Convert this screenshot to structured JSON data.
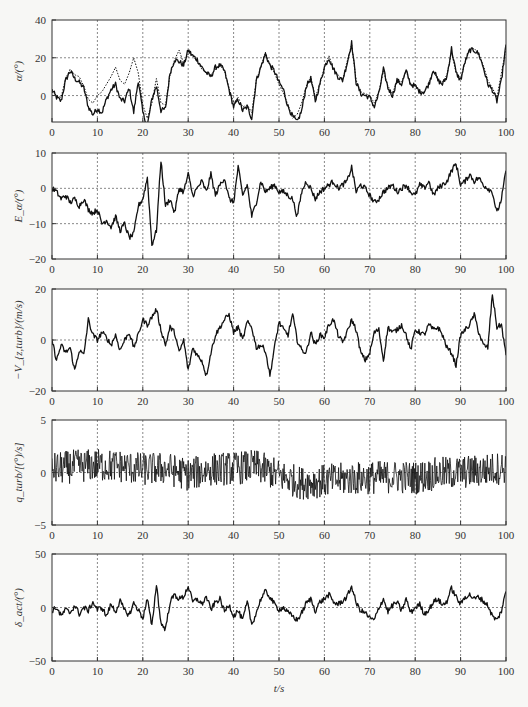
{
  "figure": {
    "xlabel": "t/s",
    "x_ticks": [
      0,
      10,
      20,
      30,
      40,
      50,
      60,
      70,
      80,
      90,
      100
    ],
    "line_color": "#111111",
    "grid_color": "#555555",
    "frame_color": "#333333"
  },
  "chart_data": [
    {
      "type": "line",
      "title": "",
      "ylabel": "α/(°)",
      "xlabel": "t/s",
      "xlim": [
        0,
        100
      ],
      "ylim": [
        -14,
        40
      ],
      "y_ticks": [
        0,
        20,
        40
      ],
      "grid": true,
      "series": [
        {
          "name": "α (solid)",
          "style": "solid",
          "x": [
            0,
            1,
            2,
            3,
            4,
            5,
            6,
            7,
            8,
            9,
            10,
            11,
            12,
            13,
            14,
            15,
            16,
            17,
            18,
            19,
            20,
            21,
            22,
            23,
            24,
            25,
            26,
            27,
            28,
            29,
            30,
            31,
            32,
            33,
            34,
            35,
            36,
            37,
            38,
            39,
            40,
            41,
            42,
            43,
            44,
            45,
            46,
            47,
            48,
            49,
            50,
            51,
            52,
            53,
            54,
            55,
            56,
            57,
            58,
            59,
            60,
            61,
            62,
            63,
            64,
            65,
            66,
            67,
            68,
            69,
            70,
            71,
            72,
            73,
            74,
            75,
            76,
            77,
            78,
            79,
            80,
            81,
            82,
            83,
            84,
            85,
            86,
            87,
            88,
            89,
            90,
            91,
            92,
            93,
            94,
            95,
            96,
            97,
            98,
            99,
            100
          ],
          "values": [
            3,
            -1,
            -3,
            8,
            13,
            9,
            7,
            4,
            -6,
            -10,
            -7,
            -9,
            -2,
            3,
            6,
            -2,
            -3,
            4,
            -9,
            8,
            -9,
            -16,
            -2,
            5,
            -8,
            -7,
            12,
            19,
            18,
            16,
            24,
            21,
            19,
            15,
            12,
            10,
            15,
            16,
            13,
            3,
            -6,
            -2,
            -8,
            -6,
            -12,
            8,
            15,
            22,
            16,
            13,
            7,
            3,
            -6,
            -11,
            -14,
            -8,
            5,
            9,
            -3,
            6,
            15,
            20,
            14,
            10,
            8,
            17,
            28,
            7,
            1,
            0,
            -1,
            -6,
            1,
            14,
            4,
            0,
            8,
            6,
            13,
            6,
            5,
            2,
            2,
            6,
            14,
            8,
            6,
            10,
            25,
            12,
            8,
            18,
            24,
            24,
            22,
            15,
            6,
            3,
            -3,
            8,
            27
          ]
        },
        {
          "name": "α reference (dotted)",
          "style": "dotted",
          "x": [
            0,
            1,
            2,
            3,
            4,
            5,
            6,
            7,
            8,
            9,
            10,
            11,
            12,
            13,
            14,
            15,
            16,
            17,
            18,
            19,
            20,
            21,
            22,
            23,
            24,
            25,
            26,
            27,
            28,
            29,
            30,
            31,
            32,
            33,
            34,
            35,
            36,
            37,
            38,
            39,
            40,
            41,
            42,
            43,
            44,
            45,
            46,
            47,
            48,
            49,
            50,
            51,
            52,
            53,
            54,
            55,
            56,
            57,
            58,
            59,
            60,
            61,
            62,
            63,
            64,
            65,
            66,
            67,
            68,
            69,
            70,
            71,
            72,
            73,
            74,
            75,
            76,
            77,
            78,
            79,
            80,
            81,
            82,
            83,
            84,
            85,
            86,
            87,
            88,
            89,
            90,
            91,
            92,
            93,
            94,
            95,
            96,
            97,
            98,
            99,
            100
          ],
          "values": [
            2,
            0,
            -1,
            9,
            14,
            11,
            10,
            5,
            -2,
            -4,
            0,
            2,
            6,
            10,
            15,
            8,
            6,
            12,
            20,
            12,
            -5,
            -12,
            -4,
            9,
            -4,
            -5,
            11,
            19,
            24,
            17,
            22,
            21,
            18,
            14,
            12,
            11,
            14,
            16,
            13,
            4,
            -4,
            -1,
            -6,
            -5,
            -9,
            8,
            15,
            23,
            16,
            12,
            6,
            1,
            -5,
            -12,
            -10,
            -4,
            5,
            10,
            -1,
            6,
            15,
            21,
            14,
            11,
            8,
            18,
            27,
            8,
            2,
            1,
            0,
            -4,
            2,
            13,
            5,
            1,
            8,
            7,
            13,
            6,
            5,
            2,
            2,
            7,
            13,
            8,
            7,
            11,
            23,
            12,
            9,
            18,
            24,
            25,
            22,
            16,
            8,
            4,
            -1,
            12,
            25
          ]
        }
      ]
    },
    {
      "type": "line",
      "title": "",
      "ylabel": "E_α/(°)",
      "xlabel": "t/s",
      "xlim": [
        0,
        100
      ],
      "ylim": [
        -20,
        10
      ],
      "y_ticks": [
        -20,
        -10,
        0,
        10
      ],
      "grid": true,
      "series": [
        {
          "name": "E_α",
          "style": "solid",
          "x": [
            0,
            1,
            2,
            3,
            4,
            5,
            6,
            7,
            8,
            9,
            10,
            11,
            12,
            13,
            14,
            15,
            16,
            17,
            18,
            19,
            20,
            21,
            22,
            23,
            24,
            25,
            26,
            27,
            28,
            29,
            30,
            31,
            32,
            33,
            34,
            35,
            36,
            37,
            38,
            39,
            40,
            41,
            42,
            43,
            44,
            45,
            46,
            47,
            48,
            49,
            50,
            51,
            52,
            53,
            54,
            55,
            56,
            57,
            58,
            59,
            60,
            61,
            62,
            63,
            64,
            65,
            66,
            67,
            68,
            69,
            70,
            71,
            72,
            73,
            74,
            75,
            76,
            77,
            78,
            79,
            80,
            81,
            82,
            83,
            84,
            85,
            86,
            87,
            88,
            89,
            90,
            91,
            92,
            93,
            94,
            95,
            96,
            97,
            98,
            99,
            100
          ],
          "values": [
            0,
            -1,
            -3,
            -2,
            -4,
            -3,
            -5,
            -3,
            -6,
            -7,
            -6,
            -10,
            -9,
            -11,
            -8,
            -12,
            -10,
            -14,
            -13,
            -5,
            -3,
            3,
            -16,
            -12,
            8,
            -5,
            -3,
            -7,
            0,
            -1,
            4,
            -2,
            0,
            2,
            -1,
            4,
            -2,
            1,
            3,
            -3,
            -4,
            6,
            -2,
            1,
            -8,
            -4,
            2,
            -1,
            0,
            1,
            -1,
            -1,
            -2,
            -3,
            -8,
            -1,
            2,
            0,
            -3,
            -1,
            0,
            1,
            2,
            0,
            1,
            2,
            6,
            -1,
            1,
            0,
            -2,
            -4,
            -3,
            -1,
            0,
            1,
            -1,
            0,
            1,
            -1,
            -2,
            1,
            0,
            2,
            -2,
            0,
            1,
            2,
            5,
            7,
            1,
            2,
            4,
            2,
            3,
            1,
            0,
            -1,
            -7,
            -3,
            5
          ]
        }
      ]
    },
    {
      "type": "line",
      "title": "",
      "ylabel": "−V_{z,turb}/(m/s)",
      "xlabel": "t/s",
      "xlim": [
        0,
        100
      ],
      "ylim": [
        -20,
        20
      ],
      "y_ticks": [
        -20,
        0,
        20
      ],
      "grid": true,
      "series": [
        {
          "name": "−V_z,turb",
          "style": "solid",
          "x": [
            0,
            1,
            2,
            3,
            4,
            5,
            6,
            7,
            8,
            9,
            10,
            11,
            12,
            13,
            14,
            15,
            16,
            17,
            18,
            19,
            20,
            21,
            22,
            23,
            24,
            25,
            26,
            27,
            28,
            29,
            30,
            31,
            32,
            33,
            34,
            35,
            36,
            37,
            38,
            39,
            40,
            41,
            42,
            43,
            44,
            45,
            46,
            47,
            48,
            49,
            50,
            51,
            52,
            53,
            54,
            55,
            56,
            57,
            58,
            59,
            60,
            61,
            62,
            63,
            64,
            65,
            66,
            67,
            68,
            69,
            70,
            71,
            72,
            73,
            74,
            75,
            76,
            77,
            78,
            79,
            80,
            81,
            82,
            83,
            84,
            85,
            86,
            87,
            88,
            89,
            90,
            91,
            92,
            93,
            94,
            95,
            96,
            97,
            98,
            99,
            100
          ],
          "values": [
            0,
            -8,
            -2,
            -5,
            -3,
            -12,
            -4,
            -6,
            8,
            2,
            0,
            3,
            1,
            -2,
            2,
            -4,
            0,
            3,
            -3,
            2,
            8,
            6,
            9,
            12,
            4,
            -2,
            5,
            3,
            -5,
            0,
            -12,
            -3,
            -6,
            -8,
            -14,
            -5,
            2,
            5,
            8,
            10,
            3,
            5,
            0,
            7,
            5,
            -3,
            -2,
            -4,
            -14,
            -3,
            7,
            4,
            2,
            10,
            0,
            -4,
            -5,
            3,
            -2,
            2,
            1,
            6,
            8,
            2,
            -1,
            3,
            8,
            4,
            -5,
            -8,
            -5,
            3,
            4,
            -8,
            5,
            3,
            4,
            6,
            2,
            -4,
            4,
            3,
            2,
            6,
            4,
            5,
            2,
            -3,
            -5,
            -10,
            2,
            4,
            6,
            10,
            3,
            -2,
            -3,
            18,
            5,
            6,
            -6
          ]
        }
      ]
    },
    {
      "type": "line",
      "title": "",
      "ylabel": "q_turb/[(°)/s]",
      "xlabel": "t/s",
      "xlim": [
        0,
        100
      ],
      "ylim": [
        -5,
        5
      ],
      "y_ticks": [
        -5,
        0,
        5
      ],
      "grid": true,
      "noise_band_description": "high-frequency noise of amplitude roughly ±1.5 around a slowly varying mean",
      "series": [
        {
          "name": "q_turb (mean trend)",
          "style": "solid",
          "x": [
            0,
            5,
            10,
            15,
            20,
            25,
            30,
            35,
            40,
            45,
            50,
            55,
            60,
            65,
            70,
            75,
            80,
            85,
            90,
            95,
            100
          ],
          "values": [
            0.3,
            0.6,
            0.7,
            0.6,
            0.3,
            0.4,
            -0.2,
            0.3,
            0.4,
            0.6,
            -0.3,
            -1.0,
            -0.8,
            -0.6,
            -0.5,
            -0.4,
            -0.5,
            -0.1,
            0.0,
            0.2,
            0.5
          ]
        }
      ]
    },
    {
      "type": "line",
      "title": "",
      "ylabel": "δ_act/(°)",
      "xlabel": "t/s",
      "xlim": [
        0,
        100
      ],
      "ylim": [
        -50,
        50
      ],
      "y_ticks": [
        -50,
        0,
        50
      ],
      "grid": true,
      "series": [
        {
          "name": "δ_act",
          "style": "solid",
          "x": [
            0,
            1,
            2,
            3,
            4,
            5,
            6,
            7,
            8,
            9,
            10,
            11,
            12,
            13,
            14,
            15,
            16,
            17,
            18,
            19,
            20,
            21,
            22,
            23,
            24,
            25,
            26,
            27,
            28,
            29,
            30,
            31,
            32,
            33,
            34,
            35,
            36,
            37,
            38,
            39,
            40,
            41,
            42,
            43,
            44,
            45,
            46,
            47,
            48,
            49,
            50,
            51,
            52,
            53,
            54,
            55,
            56,
            57,
            58,
            59,
            60,
            61,
            62,
            63,
            64,
            65,
            66,
            67,
            68,
            69,
            70,
            71,
            72,
            73,
            74,
            75,
            76,
            77,
            78,
            79,
            80,
            81,
            82,
            83,
            84,
            85,
            86,
            87,
            88,
            89,
            90,
            91,
            92,
            93,
            94,
            95,
            96,
            97,
            98,
            99,
            100
          ],
          "values": [
            -3,
            0,
            -8,
            -2,
            -5,
            2,
            -6,
            0,
            -3,
            5,
            -2,
            0,
            -8,
            3,
            -4,
            6,
            -3,
            -7,
            4,
            -2,
            -10,
            8,
            -18,
            22,
            -15,
            -20,
            5,
            12,
            8,
            10,
            20,
            5,
            8,
            3,
            10,
            -2,
            5,
            8,
            -4,
            3,
            -8,
            -3,
            -12,
            5,
            -16,
            -5,
            8,
            15,
            10,
            3,
            -2,
            0,
            -5,
            -8,
            -12,
            -5,
            4,
            8,
            -3,
            5,
            8,
            12,
            5,
            3,
            6,
            10,
            20,
            4,
            -3,
            -5,
            -10,
            -12,
            0,
            8,
            -4,
            2,
            5,
            -3,
            8,
            -5,
            0,
            3,
            -6,
            -2,
            5,
            8,
            2,
            6,
            18,
            10,
            3,
            10,
            12,
            8,
            10,
            6,
            2,
            -8,
            -12,
            -3,
            15
          ]
        }
      ]
    }
  ]
}
